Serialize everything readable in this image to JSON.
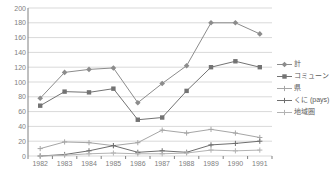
{
  "chart_data": {
    "type": "line",
    "title": "",
    "xlabel": "",
    "ylabel": "",
    "categories": [
      "1982",
      "1983",
      "1984",
      "1985",
      "1986",
      "1987",
      "1988",
      "1989",
      "1990",
      "1991"
    ],
    "ylim": [
      0,
      200
    ],
    "ytick_step": 20,
    "yticks": [
      "200",
      "180",
      "160",
      "140",
      "120",
      "100",
      "80",
      "60",
      "40",
      "20",
      "0"
    ],
    "grid": true,
    "legend_position": "right",
    "series": [
      {
        "name": "計",
        "color": "#8c8c8c",
        "marker": "diamond",
        "values": [
          78,
          113,
          117,
          119,
          72,
          98,
          122,
          180,
          180,
          165
        ]
      },
      {
        "name": "コミューン",
        "color": "#737373",
        "marker": "square",
        "values": [
          68,
          87,
          86,
          91,
          49,
          52,
          88,
          120,
          128,
          120
        ]
      },
      {
        "name": "県",
        "color": "#a6a6a6",
        "marker": "plus",
        "values": [
          10,
          19,
          18,
          14,
          18,
          35,
          31,
          36,
          31,
          25
        ]
      },
      {
        "name": "くに (pays)",
        "color": "#6e6e6e",
        "marker": "plus",
        "values": [
          0,
          2,
          7,
          14,
          5,
          7,
          5,
          15,
          17,
          20
        ]
      },
      {
        "name": "地域圏",
        "color": "#b3b3b3",
        "marker": "plus",
        "values": [
          0,
          1,
          3,
          4,
          3,
          3,
          4,
          8,
          7,
          8
        ]
      }
    ]
  },
  "style": {
    "grid_color": "#d9d9d9",
    "axis_color": "#808080",
    "tick_text_color": "#808080",
    "legend_text_color": "#595959",
    "background": "#ffffff"
  }
}
